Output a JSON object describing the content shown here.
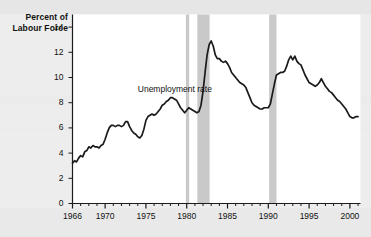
{
  "figure": {
    "background_color": "#ededed",
    "plot_background_color": "#ffffff",
    "axis_color": "#1a1a1a",
    "line_color": "#1a1a1a",
    "recession_band_color": "#c9c9c9"
  },
  "axis_titles": {
    "y_line1": "Percent of",
    "y_line2": "Labour Force"
  },
  "annotations": [
    {
      "text": "Unemployment rate",
      "x": 1974.0,
      "y": 9.0
    }
  ],
  "chart_data": {
    "type": "line",
    "title": "",
    "xlabel": "",
    "ylabel": "Percent of Labour Force",
    "xlim": [
      1966,
      2001.3
    ],
    "ylim": [
      0,
      15
    ],
    "grid": false,
    "legend": "none",
    "y_ticks": [
      0,
      2,
      4,
      6,
      8,
      10,
      12,
      14
    ],
    "y_tick_labels": [
      "0",
      "2",
      "4",
      "6",
      "8",
      "10",
      "12",
      "14"
    ],
    "x_ticks": [
      1966,
      1970,
      1975,
      1980,
      1985,
      1990,
      1995,
      2000
    ],
    "x_tick_labels": [
      "1966",
      "1970",
      "1975",
      "1980",
      "1985",
      "1990",
      "1995",
      "2000"
    ],
    "x_minor_tick_step": 1,
    "shaded_regions": [
      {
        "label": "recession",
        "x0": 1979.9,
        "x1": 1980.3
      },
      {
        "label": "recession",
        "x0": 1981.3,
        "x1": 1982.8
      },
      {
        "label": "recession",
        "x0": 1990.1,
        "x1": 1991.0
      }
    ],
    "series": [
      {
        "name": "Unemployment rate",
        "x": [
          1966.0,
          1966.25,
          1966.5,
          1966.75,
          1967.0,
          1967.25,
          1967.5,
          1967.75,
          1968.0,
          1968.25,
          1968.5,
          1968.75,
          1969.0,
          1969.25,
          1969.5,
          1969.75,
          1970.0,
          1970.25,
          1970.5,
          1970.75,
          1971.0,
          1971.25,
          1971.5,
          1971.75,
          1972.0,
          1972.25,
          1972.5,
          1972.75,
          1973.0,
          1973.25,
          1973.5,
          1973.75,
          1974.0,
          1974.25,
          1974.5,
          1974.75,
          1975.0,
          1975.25,
          1975.5,
          1975.75,
          1976.0,
          1976.25,
          1976.5,
          1976.75,
          1977.0,
          1977.25,
          1977.5,
          1977.75,
          1978.0,
          1978.25,
          1978.5,
          1978.75,
          1979.0,
          1979.25,
          1979.5,
          1979.75,
          1980.0,
          1980.25,
          1980.5,
          1980.75,
          1981.0,
          1981.25,
          1981.5,
          1981.75,
          1982.0,
          1982.25,
          1982.5,
          1982.75,
          1983.0,
          1983.25,
          1983.5,
          1983.75,
          1984.0,
          1984.25,
          1984.5,
          1984.75,
          1985.0,
          1985.25,
          1985.5,
          1985.75,
          1986.0,
          1986.25,
          1986.5,
          1986.75,
          1987.0,
          1987.25,
          1987.5,
          1987.75,
          1988.0,
          1988.25,
          1988.5,
          1988.75,
          1989.0,
          1989.25,
          1989.5,
          1989.75,
          1990.0,
          1990.25,
          1990.5,
          1990.75,
          1991.0,
          1991.25,
          1991.5,
          1991.75,
          1992.0,
          1992.25,
          1992.5,
          1992.75,
          1993.0,
          1993.25,
          1993.5,
          1993.75,
          1994.0,
          1994.25,
          1994.5,
          1994.75,
          1995.0,
          1995.25,
          1995.5,
          1995.75,
          1996.0,
          1996.25,
          1996.5,
          1996.75,
          1997.0,
          1997.25,
          1997.5,
          1997.75,
          1998.0,
          1998.25,
          1998.5,
          1998.75,
          1999.0,
          1999.25,
          1999.5,
          1999.75,
          2000.0,
          2000.25,
          2000.5,
          2000.75,
          2001.0
        ],
        "values": [
          3.2,
          3.4,
          3.3,
          3.6,
          3.8,
          3.7,
          4.1,
          4.2,
          4.5,
          4.4,
          4.6,
          4.5,
          4.5,
          4.4,
          4.6,
          4.7,
          5.1,
          5.6,
          6.0,
          6.2,
          6.2,
          6.1,
          6.2,
          6.2,
          6.1,
          6.2,
          6.5,
          6.5,
          6.1,
          5.8,
          5.6,
          5.5,
          5.3,
          5.2,
          5.4,
          5.9,
          6.6,
          6.9,
          7.0,
          7.1,
          7.0,
          7.1,
          7.3,
          7.5,
          7.8,
          7.9,
          8.1,
          8.2,
          8.4,
          8.4,
          8.3,
          8.2,
          7.9,
          7.6,
          7.4,
          7.2,
          7.4,
          7.6,
          7.5,
          7.4,
          7.3,
          7.2,
          7.3,
          7.8,
          8.9,
          10.4,
          11.8,
          12.6,
          12.9,
          12.5,
          11.8,
          11.5,
          11.5,
          11.3,
          11.2,
          11.3,
          11.1,
          10.8,
          10.4,
          10.2,
          10.0,
          9.8,
          9.6,
          9.5,
          9.4,
          9.2,
          8.8,
          8.4,
          8.0,
          7.8,
          7.7,
          7.6,
          7.5,
          7.5,
          7.6,
          7.6,
          7.6,
          7.9,
          8.7,
          9.5,
          10.2,
          10.3,
          10.4,
          10.4,
          10.5,
          10.9,
          11.4,
          11.7,
          11.4,
          11.7,
          11.3,
          11.1,
          11.0,
          10.6,
          10.2,
          9.9,
          9.6,
          9.5,
          9.4,
          9.3,
          9.4,
          9.6,
          9.9,
          9.6,
          9.3,
          9.1,
          8.9,
          8.8,
          8.6,
          8.4,
          8.2,
          8.1,
          7.9,
          7.7,
          7.5,
          7.2,
          6.9,
          6.8,
          6.8,
          6.9,
          6.9
        ]
      }
    ]
  }
}
